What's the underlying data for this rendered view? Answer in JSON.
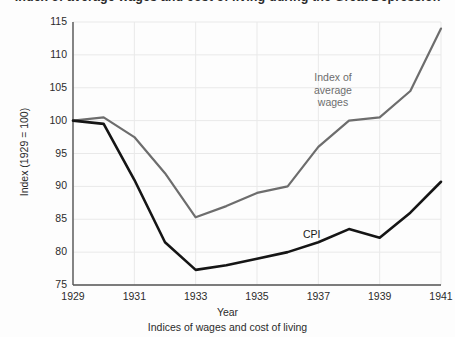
{
  "title": "Index of average wages and cost of living during the Great Depression",
  "axis": {
    "y_title": "Index (1929 = 100)",
    "x_title": "Year",
    "caption": "Indices of wages and cost of living",
    "y_ticks": [
      "75",
      "80",
      "85",
      "90",
      "95",
      "100",
      "105",
      "110",
      "115"
    ],
    "x_ticks": [
      "1929",
      "1931",
      "1933",
      "1935",
      "1937",
      "1939",
      "1941"
    ]
  },
  "labels": {
    "wages": "Index of\naverage\nwages",
    "cpi": "CPI"
  },
  "colors": {
    "wages_line": "#6d6d6d",
    "cpi_line": "#151515",
    "axis": "#555555",
    "grid": "#e9e9e9",
    "background": "#fdfdfd"
  },
  "chart_data": {
    "type": "line",
    "title": "Index of average wages and cost of living during the Great Depression",
    "xlabel": "Year",
    "ylabel": "Index (1929 = 100)",
    "caption": "Indices of wages and cost of living",
    "xlim": [
      1929,
      1941
    ],
    "ylim": [
      75,
      115
    ],
    "ytick_step": 5,
    "xtick_step": 2,
    "grid": true,
    "legend": "inline-labels",
    "x": [
      1929,
      1930,
      1931,
      1932,
      1933,
      1934,
      1935,
      1936,
      1937,
      1938,
      1939,
      1940,
      1941
    ],
    "series": [
      {
        "name": "Index of average wages",
        "color": "#6d6d6d",
        "values": [
          100,
          100.5,
          97.5,
          92,
          85.3,
          87,
          89,
          90,
          96,
          100,
          100.5,
          104.5,
          114
        ]
      },
      {
        "name": "CPI",
        "color": "#151515",
        "values": [
          100,
          99.5,
          91,
          81.5,
          77.3,
          78,
          79,
          80,
          81.5,
          83.5,
          82.2,
          86,
          90.7
        ]
      }
    ]
  }
}
